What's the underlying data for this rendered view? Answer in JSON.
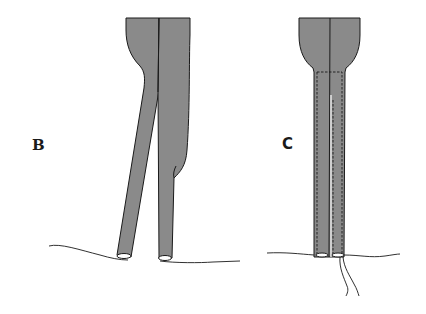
{
  "figure": {
    "panels": [
      {
        "id": "B",
        "label": "B",
        "description": "Two tubular strands diverging from a shared top, resting on a line"
      },
      {
        "id": "C",
        "label": "C",
        "description": "Two parallel tubular strands with dashed stitch outline, resting on a line with threads hanging below"
      }
    ],
    "colors": {
      "fill": "#8a8a8a",
      "stroke": "#1a1a1a",
      "background": "#ffffff"
    }
  }
}
